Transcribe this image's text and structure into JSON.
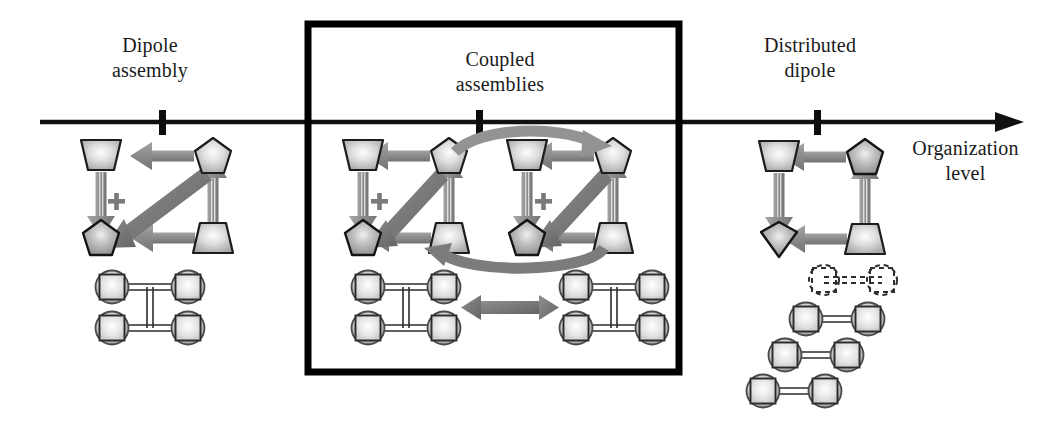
{
  "diagram": {
    "title_type": "organization-level-axis-diagram",
    "axis": {
      "label": "Organization\nlevel",
      "arrow_direction": "right",
      "tick_count": 3,
      "tick_positions_px": [
        163,
        480,
        818
      ],
      "y_px": 122,
      "x_start_px": 40,
      "x_end_px": 1012,
      "color": "#111111"
    },
    "stages": [
      {
        "id": "dipole-assembly",
        "label": "Dipole\nassembly",
        "boxed": false,
        "assemblies": 1,
        "has_diagonal_arrow": true,
        "plus_sign": "+",
        "lower_motif": "h-cluster",
        "lower_motif_count": 1
      },
      {
        "id": "coupled-assemblies",
        "label": "Coupled\nassemblies",
        "boxed": true,
        "assemblies": 2,
        "has_diagonal_arrow": true,
        "plus_sign": "+",
        "lower_motif": "h-cluster",
        "lower_motif_count": 2,
        "coupling_arrow": "curved-double-ellipse",
        "lower_link_arrow": "double-headed-horizontal"
      },
      {
        "id": "distributed-dipole",
        "label": "Distributed\ndipole",
        "boxed": false,
        "assemblies": 1,
        "has_diagonal_arrow": false,
        "plus_sign": "",
        "lower_motif": "staircase-pairs",
        "lower_motif_count": 3,
        "ghost_motif": "dashed-pair"
      }
    ],
    "node_shapes": {
      "top_left": "trapezoid-wide-top",
      "top_right": "pentagon",
      "bottom_left": "pentagon",
      "bottom_right": "trapezoid-narrow-top",
      "distributed_bottom_left": "kite-diamond"
    },
    "colors": {
      "axis": "#111111",
      "box_border": "#000000",
      "arrow_gray": "#8c8c8c",
      "arrow_gray_dark": "#6e6e6e",
      "shape_outline": "#1c1c1c",
      "shape_fill_light": "#f0f0f0",
      "shape_fill_mid": "#b8b8b8",
      "plus_sign": "#7a7a7a",
      "ghost_dash": "#3a3a3a",
      "text": "#1a1a1a"
    }
  }
}
